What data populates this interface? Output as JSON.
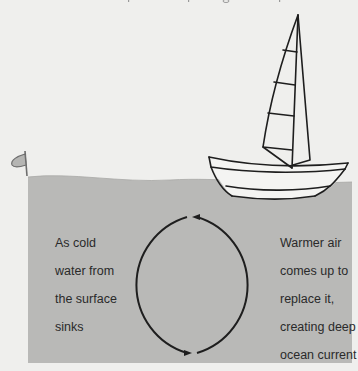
{
  "diagram": {
    "title_partial": "",
    "colors": {
      "background": "#efefed",
      "water": "#b9b9b7",
      "water_surface_light": "#cfcfcd",
      "line": "#1e1e1e",
      "text": "#2a2a2a"
    },
    "labels": {
      "left": {
        "lines": [
          "As cold",
          "water from",
          "the surface",
          "sinks"
        ]
      },
      "right": {
        "lines": [
          "Warmer air",
          "comes up to",
          "replace it,",
          "creating deep",
          "ocean current"
        ]
      }
    },
    "elements": {
      "boat": "sailboat-icon",
      "buoy": "buoy-marker-icon",
      "cycle": "circular-arrows-icon"
    }
  }
}
